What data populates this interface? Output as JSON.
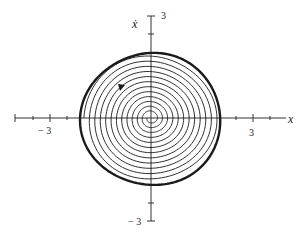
{
  "figure": {
    "type": "phase-portrait",
    "x_axis_label": "x",
    "y_axis_label": "ẋ",
    "tick_labels": {
      "x_neg": "− 3",
      "x_pos": "3",
      "y_pos": "3",
      "y_neg": "− 3"
    },
    "axis_range": {
      "x": [
        -4,
        4
      ],
      "y": [
        -3,
        3
      ]
    },
    "limit_cycle": {
      "approx_radius": 2.0,
      "description": "stable limit cycle (thick outer closed orbit)"
    },
    "spiral": {
      "turns_visible": 12,
      "direction": "outward from origin toward limit cycle"
    },
    "arrow_direction": "clockwise",
    "colors": {
      "ink": "#1a1a1a",
      "background": "#ffffff"
    }
  },
  "chart_data": {
    "type": "line",
    "title": "",
    "xlabel": "x",
    "ylabel": "ẋ",
    "xlim": [
      -4,
      4
    ],
    "ylim": [
      -3,
      3
    ],
    "xticks": [
      -3,
      3
    ],
    "yticks": [
      3,
      -3
    ],
    "grid": false,
    "series": [
      {
        "name": "trajectory spiral",
        "description": "unstable focus at origin spiraling outward"
      },
      {
        "name": "limit cycle",
        "approx_points": [
          [
            -2.0,
            0
          ],
          [
            0,
            1.95
          ],
          [
            2.0,
            0
          ],
          [
            0,
            -2.0
          ]
        ]
      }
    ]
  }
}
